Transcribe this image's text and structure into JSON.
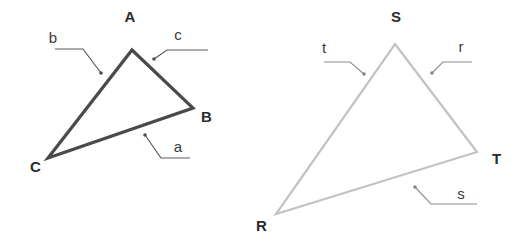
{
  "figure": {
    "background_color": "#ffffff",
    "width": 527,
    "height": 251
  },
  "triangles": [
    {
      "id": "triangle-abc",
      "name": "left-triangle",
      "stroke_color": "#4a4a4a",
      "stroke_width": 3.2,
      "vertices": [
        {
          "label": "A",
          "x": 132,
          "y": 37,
          "point_x": 132,
          "point_y": 50,
          "label_x": 130,
          "label_y": 22
        },
        {
          "label": "B",
          "x": 193,
          "y": 108,
          "point_x": 193,
          "point_y": 108,
          "label_x": 201,
          "label_y": 122
        },
        {
          "label": "C",
          "x": 48,
          "y": 155,
          "point_x": 48,
          "point_y": 158,
          "label_x": 30,
          "label_y": 172
        }
      ],
      "sides": [
        {
          "label": "a",
          "opposite_vertex": "A",
          "label_x": 178,
          "label_y": 152,
          "dot_x": 145,
          "dot_y": 135,
          "elbow_x": 161,
          "elbow_y": 158,
          "tail_x": 190,
          "tail_y": 158
        },
        {
          "label": "b",
          "opposite_vertex": "B",
          "label_x": 53,
          "label_y": 43,
          "dot_x": 101,
          "dot_y": 73,
          "elbow_x": 83,
          "elbow_y": 49,
          "tail_x": 55,
          "tail_y": 49
        },
        {
          "label": "c",
          "opposite_vertex": "C",
          "label_x": 178,
          "label_y": 40,
          "dot_x": 154,
          "dot_y": 59,
          "elbow_x": 167,
          "elbow_y": 50,
          "tail_x": 208,
          "tail_y": 50
        }
      ]
    },
    {
      "id": "triangle-rst",
      "name": "right-triangle",
      "stroke_color": "#c2c2c2",
      "stroke_width": 2.2,
      "vertices": [
        {
          "label": "S",
          "x": 395,
          "y": 44,
          "point_x": 395,
          "point_y": 44,
          "label_x": 390,
          "label_y": 22
        },
        {
          "label": "T",
          "x": 477,
          "y": 152,
          "point_x": 477,
          "point_y": 152,
          "label_x": 492,
          "label_y": 164
        },
        {
          "label": "R",
          "x": 276,
          "y": 214,
          "point_x": 276,
          "point_y": 214,
          "label_x": 256,
          "label_y": 231
        }
      ],
      "sides": [
        {
          "label": "r",
          "opposite_vertex": "R",
          "label_x": 460,
          "label_y": 52,
          "dot_x": 432,
          "dot_y": 73,
          "elbow_x": 443,
          "elbow_y": 62,
          "tail_x": 472,
          "tail_y": 62
        },
        {
          "label": "s",
          "opposite_vertex": "S",
          "label_x": 460,
          "label_y": 199,
          "dot_x": 415,
          "dot_y": 187,
          "elbow_x": 431,
          "elbow_y": 204,
          "tail_x": 477,
          "tail_y": 204
        },
        {
          "label": "t",
          "opposite_vertex": "T",
          "label_x": 323,
          "label_y": 53,
          "dot_x": 364,
          "dot_y": 74,
          "elbow_x": 350,
          "elbow_y": 62,
          "tail_x": 324,
          "tail_y": 62
        }
      ]
    }
  ]
}
